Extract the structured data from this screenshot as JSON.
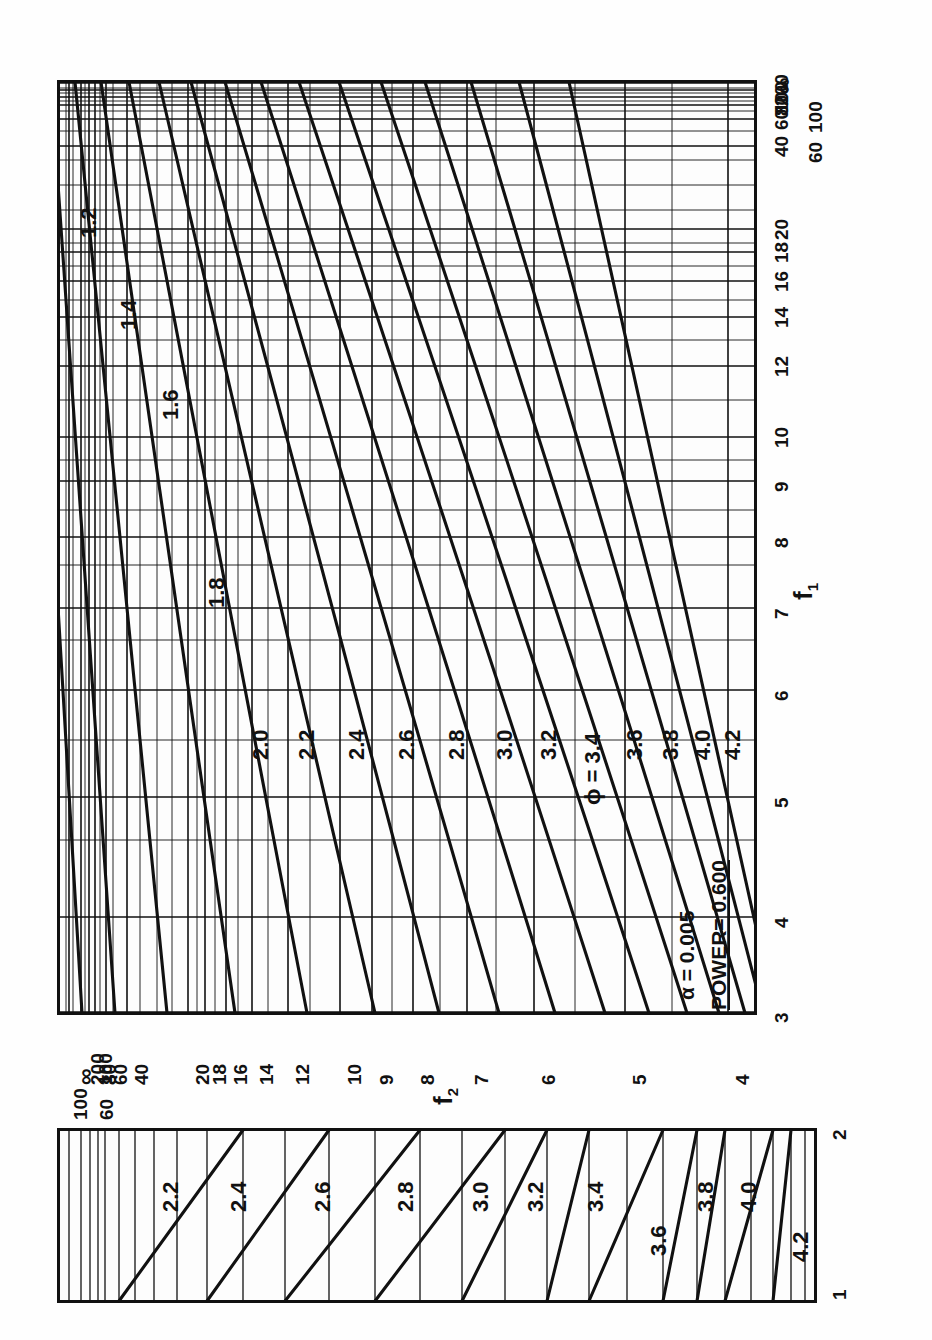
{
  "figure": {
    "orientation": "rotated-90",
    "annotations": {
      "alpha_label": "α   = 0.005",
      "power_label": "POWER= 0.600",
      "phi_label": "ϕ = 3.4"
    },
    "axis_names": {
      "f1": "f",
      "f1_sub": "1",
      "f2": "f",
      "f2_sub": "2"
    }
  },
  "chart_data": {
    "type": "line",
    "subtitle": "α = 0.005, POWER = 0.600",
    "xlabel": "f1",
    "ylabel": "f2",
    "grid": true,
    "legend": "inline curve labels",
    "main_panel": {
      "x_name": "f1",
      "x_ticks": [
        3,
        4,
        5,
        6,
        7,
        8,
        9,
        10,
        12,
        14,
        16,
        18,
        20,
        40,
        60,
        80,
        100,
        200,
        "∞"
      ],
      "x_tick_labels": [
        "3",
        "4",
        "5",
        "6",
        "7",
        "8",
        "9",
        "10",
        "12",
        "14",
        "16",
        "18",
        "20",
        "40",
        "60",
        "80",
        "100",
        "200",
        "∞"
      ],
      "x_minor_ticks": [
        11,
        13,
        15,
        17,
        19,
        25,
        30,
        35,
        50,
        70,
        90,
        150
      ],
      "y_name": "f2",
      "y_ticks": [
        4,
        5,
        6,
        7,
        8,
        9,
        10,
        12,
        14,
        16,
        18,
        20,
        40,
        60,
        80,
        100,
        200,
        "∞"
      ],
      "y_tick_labels": [
        "4",
        "5",
        "6",
        "7",
        "8",
        "9",
        "10",
        "12",
        "14",
        "16",
        "18",
        "20",
        "40",
        "60",
        "80",
        "100",
        "200",
        "∞"
      ],
      "phi_curves": [
        1.2,
        1.4,
        1.6,
        1.8,
        2.0,
        2.2,
        2.4,
        2.6,
        2.8,
        3.0,
        3.2,
        3.4,
        3.6,
        3.8,
        4.0,
        4.2
      ],
      "phi_curve_labels": [
        "1.2",
        "1.4",
        "1.6",
        "1.8",
        "2.0",
        "2.2",
        "2.4",
        "2.6",
        "2.8",
        "3.0",
        "ϕ = 3.4",
        "3.2",
        "3.6",
        "3.8",
        "4.0",
        "4.2"
      ]
    },
    "inset_panel": {
      "x_name": "f1",
      "x_ticks": [
        1,
        2
      ],
      "x_tick_labels": [
        "1",
        "2"
      ],
      "phi_curves": [
        2.2,
        2.4,
        2.6,
        2.8,
        3.0,
        3.2,
        3.4,
        3.6,
        3.8,
        4.0,
        4.2
      ],
      "phi_curve_labels": [
        "2.2",
        "2.4",
        "2.6",
        "2.8",
        "3.0",
        "3.2",
        "3.4",
        "3.6",
        "3.8",
        "4.0",
        "4.2"
      ]
    }
  },
  "main_axis": {
    "f1_ticks": [
      {
        "label": "3",
        "y": 1012
      },
      {
        "label": "4",
        "y": 917
      },
      {
        "label": "5",
        "y": 797
      },
      {
        "label": "6",
        "y": 690
      },
      {
        "label": "7",
        "y": 608
      },
      {
        "label": "8",
        "y": 537
      },
      {
        "label": "9",
        "y": 481
      },
      {
        "label": "10",
        "y": 437
      },
      {
        "label": "12",
        "y": 366
      },
      {
        "label": "14",
        "y": 317
      },
      {
        "label": "16",
        "y": 281
      },
      {
        "label": "18",
        "y": 252
      },
      {
        "label": "20",
        "y": 229
      },
      {
        "label": "40",
        "y": 146
      },
      {
        "label": "60",
        "y": 119
      },
      {
        "label": "80",
        "y": 105
      },
      {
        "label": "100",
        "y": 97
      },
      {
        "label": "200",
        "y": 90
      },
      {
        "label": "∞",
        "y": 83
      }
    ],
    "f2_ticks": [
      {
        "label": "4",
        "x": 728
      },
      {
        "label": "5",
        "x": 625
      },
      {
        "label": "6",
        "x": 534
      },
      {
        "label": "7",
        "x": 467
      },
      {
        "label": "8",
        "x": 413
      },
      {
        "label": "9",
        "x": 372
      },
      {
        "label": "10",
        "x": 340
      },
      {
        "label": "12",
        "x": 288
      },
      {
        "label": "14",
        "x": 252
      },
      {
        "label": "16",
        "x": 226
      },
      {
        "label": "18",
        "x": 205
      },
      {
        "label": "20",
        "x": 188
      },
      {
        "label": "40",
        "x": 127
      },
      {
        "label": "60",
        "x": 106
      },
      {
        "label": "80",
        "x": 95
      },
      {
        "label": "100",
        "x": 89
      },
      {
        "label": "200",
        "x": 81
      },
      {
        "label": "∞",
        "x": 69
      }
    ]
  },
  "inset_axis": {
    "ticks": [
      {
        "label": "2",
        "pos": "top"
      },
      {
        "label": "1",
        "pos": "bottom"
      }
    ]
  }
}
